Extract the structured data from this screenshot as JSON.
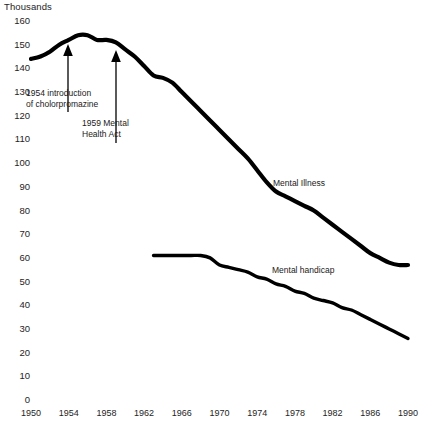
{
  "chart_data": {
    "type": "line",
    "title": "",
    "unit_label": "Thousands",
    "xlabel": "",
    "ylabel": "Thousands",
    "xlim": [
      1950,
      1990
    ],
    "ylim": [
      0,
      160
    ],
    "grid": false,
    "legend_position": "inline-annotation",
    "y_ticks": [
      160,
      150,
      140,
      130,
      120,
      110,
      100,
      90,
      80,
      70,
      60,
      50,
      40,
      30,
      20,
      10,
      0
    ],
    "x_ticks": [
      1950,
      1954,
      1958,
      1962,
      1966,
      1970,
      1974,
      1978,
      1982,
      1986,
      1990
    ],
    "series": [
      {
        "name": "Mental Illness",
        "x": [
          1950,
          1951,
          1952,
          1953,
          1954,
          1955,
          1956,
          1957,
          1958,
          1959,
          1960,
          1961,
          1962,
          1963,
          1964,
          1965,
          1966,
          1967,
          1968,
          1969,
          1970,
          1971,
          1972,
          1973,
          1974,
          1975,
          1976,
          1977,
          1978,
          1979,
          1980,
          1981,
          1982,
          1983,
          1984,
          1985,
          1986,
          1987,
          1988,
          1989,
          1990
        ],
        "values": [
          144,
          145,
          147,
          150,
          152,
          154,
          154,
          152,
          152,
          151,
          148,
          145,
          141,
          137,
          136,
          134,
          130,
          126,
          122,
          118,
          114,
          110,
          106,
          102,
          97,
          92,
          88,
          86,
          84,
          82,
          80,
          77,
          74,
          71,
          68,
          65,
          62,
          60,
          58,
          57,
          57
        ]
      },
      {
        "name": "Mental handicap",
        "x": [
          1963,
          1964,
          1965,
          1966,
          1967,
          1968,
          1969,
          1970,
          1971,
          1972,
          1973,
          1974,
          1975,
          1976,
          1977,
          1978,
          1979,
          1980,
          1981,
          1982,
          1983,
          1984,
          1985,
          1986,
          1987,
          1988,
          1989,
          1990
        ],
        "values": [
          61,
          61,
          61,
          61,
          61,
          61,
          60,
          57,
          56,
          55,
          54,
          52,
          51,
          49,
          48,
          46,
          45,
          43,
          42,
          41,
          39,
          38,
          36,
          34,
          32,
          30,
          28,
          26
        ]
      }
    ],
    "annotations": [
      {
        "name": "chlorpromazine-annotation",
        "text": "1954 introduction\nof cholorpromazine",
        "points_to_year": 1954,
        "points_to_value": 152
      },
      {
        "name": "mental-health-act-annotation",
        "text": "1959 Mental\nHealth Act",
        "points_to_year": 1959,
        "points_to_value": 151
      }
    ]
  },
  "colors": {
    "line": "#000000",
    "text": "#1a1a1a",
    "background": "#ffffff"
  }
}
